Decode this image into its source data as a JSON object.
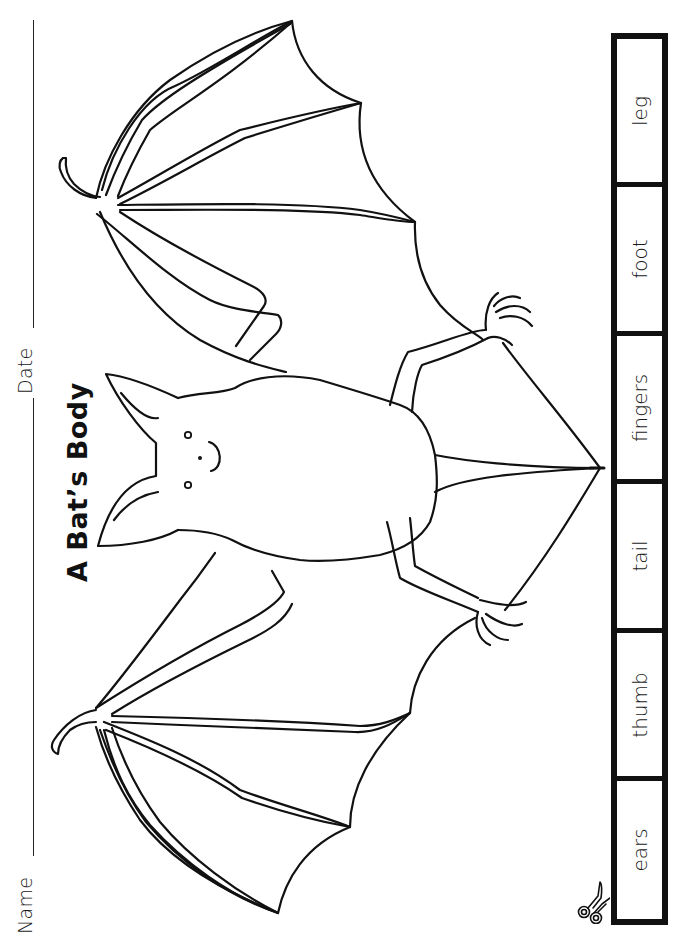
{
  "worksheet": {
    "title": "A Bat’s Body",
    "fields": {
      "name_label": "Name",
      "date_label": "Date"
    },
    "illustration": {
      "subject": "bat-with-outstretched-wings",
      "style": "black line art coloring page"
    },
    "cutout_strip": {
      "cut_icon": "scissors-icon",
      "labels": [
        "leg",
        "foot",
        "fingers",
        "tail",
        "thumb",
        "ears"
      ]
    },
    "colors": {
      "ink": "#111111",
      "paper": "#ffffff"
    }
  }
}
